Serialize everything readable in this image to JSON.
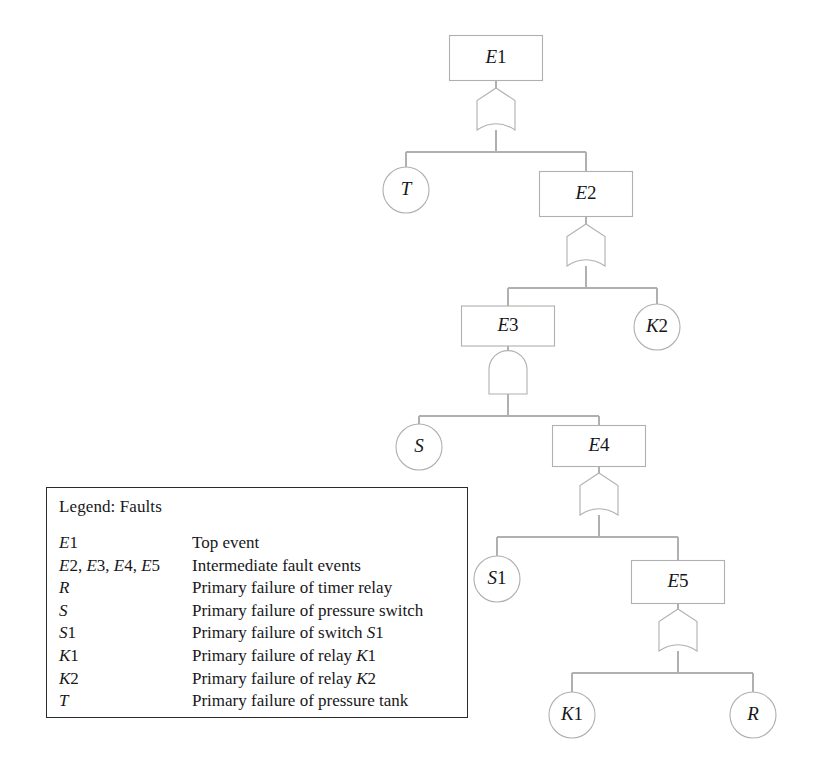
{
  "diagram": {
    "type": "fault-tree",
    "line_color": "#b0b0b0",
    "text_color": "#17171a",
    "legend_border_color": "#2b2b2b",
    "nodes": [
      {
        "id": "E1",
        "label": "E1",
        "shape": "rect",
        "kind": "top-event",
        "cx": 496,
        "cy": 58,
        "w": 93,
        "h": 45,
        "italic_prefix": "E",
        "rest": "1"
      },
      {
        "id": "E2",
        "label": "E2",
        "shape": "rect",
        "kind": "intermediate-event",
        "cx": 586,
        "cy": 194,
        "w": 93,
        "h": 45,
        "italic_prefix": "E",
        "rest": "2"
      },
      {
        "id": "E3",
        "label": "E3",
        "shape": "rect",
        "kind": "intermediate-event",
        "cx": 508,
        "cy": 326,
        "w": 93,
        "h": 40,
        "italic_prefix": "E",
        "rest": "3"
      },
      {
        "id": "E4",
        "label": "E4",
        "shape": "rect",
        "kind": "intermediate-event",
        "cx": 599,
        "cy": 446,
        "w": 93,
        "h": 41,
        "italic_prefix": "E",
        "rest": "4"
      },
      {
        "id": "E5",
        "label": "E5",
        "shape": "rect",
        "kind": "intermediate-event",
        "cx": 678,
        "cy": 582,
        "w": 93,
        "h": 43,
        "italic_prefix": "E",
        "rest": "5"
      },
      {
        "id": "T",
        "label": "T",
        "shape": "circle",
        "kind": "basic-event",
        "cx": 406,
        "cy": 190,
        "r": 23,
        "italic_prefix": "T",
        "rest": ""
      },
      {
        "id": "K2",
        "label": "K2",
        "shape": "circle",
        "kind": "basic-event",
        "cx": 657,
        "cy": 327,
        "r": 23,
        "italic_prefix": "K",
        "rest": "2"
      },
      {
        "id": "S",
        "label": "S",
        "shape": "circle",
        "kind": "basic-event",
        "cx": 419,
        "cy": 447,
        "r": 23,
        "italic_prefix": "S",
        "rest": ""
      },
      {
        "id": "S1",
        "label": "S1",
        "shape": "circle",
        "kind": "basic-event",
        "cx": 497,
        "cy": 579,
        "r": 23,
        "italic_prefix": "S",
        "rest": "1"
      },
      {
        "id": "K1",
        "label": "K1",
        "shape": "circle",
        "kind": "basic-event",
        "cx": 572,
        "cy": 715,
        "r": 23,
        "italic_prefix": "K",
        "rest": "1"
      },
      {
        "id": "R",
        "label": "R",
        "shape": "circle",
        "kind": "basic-event",
        "cx": 753,
        "cy": 715,
        "r": 23,
        "italic_prefix": "R",
        "rest": ""
      }
    ],
    "gates": [
      {
        "id": "G1",
        "gate_type": "OR",
        "parent": "E1",
        "cx": 496,
        "top": 88,
        "children": [
          "T",
          "E2"
        ]
      },
      {
        "id": "G2",
        "gate_type": "OR",
        "parent": "E2",
        "cx": 586,
        "top": 224,
        "children": [
          "E3",
          "K2"
        ]
      },
      {
        "id": "G3",
        "gate_type": "AND",
        "parent": "E3",
        "cx": 508,
        "top": 352,
        "children": [
          "S",
          "E4"
        ]
      },
      {
        "id": "G4",
        "gate_type": "OR",
        "parent": "E4",
        "cx": 599,
        "top": 473,
        "children": [
          "S1",
          "E5"
        ]
      },
      {
        "id": "G5",
        "gate_type": "OR",
        "parent": "E5",
        "cx": 678,
        "top": 609,
        "children": [
          "K1",
          "R"
        ]
      }
    ]
  },
  "legend": {
    "title": "Legend: Faults",
    "rows": [
      {
        "symbol": "E1",
        "symbol_italic_parts": [
          [
            "E",
            "i"
          ],
          [
            "1",
            "u"
          ]
        ],
        "description": "Top event",
        "desc_parts": [
          [
            "Top event",
            "u"
          ]
        ]
      },
      {
        "symbol": "E2, E3, E4, E5",
        "symbol_italic_parts": [
          [
            "E",
            "i"
          ],
          [
            "2, ",
            "u"
          ],
          [
            "E",
            "i"
          ],
          [
            "3, ",
            "u"
          ],
          [
            "E",
            "i"
          ],
          [
            "4, ",
            "u"
          ],
          [
            "E",
            "i"
          ],
          [
            "5",
            "u"
          ]
        ],
        "description": "Intermediate fault events",
        "desc_parts": [
          [
            "Intermediate fault events",
            "u"
          ]
        ]
      },
      {
        "symbol": "R",
        "symbol_italic_parts": [
          [
            "R",
            "i"
          ]
        ],
        "description": "Primary failure of timer relay",
        "desc_parts": [
          [
            "Primary failure of timer relay",
            "u"
          ]
        ]
      },
      {
        "symbol": "S",
        "symbol_italic_parts": [
          [
            "S",
            "i"
          ]
        ],
        "description": "Primary failure of pressure switch",
        "desc_parts": [
          [
            "Primary failure of pressure switch",
            "u"
          ]
        ]
      },
      {
        "symbol": "S1",
        "symbol_italic_parts": [
          [
            "S",
            "i"
          ],
          [
            "1",
            "u"
          ]
        ],
        "description": "Primary failure of switch S1",
        "desc_parts": [
          [
            "Primary failure of switch ",
            "u"
          ],
          [
            "S",
            "i"
          ],
          [
            "1",
            "u"
          ]
        ]
      },
      {
        "symbol": "K1",
        "symbol_italic_parts": [
          [
            "K",
            "i"
          ],
          [
            "1",
            "u"
          ]
        ],
        "description": "Primary failure of relay K1",
        "desc_parts": [
          [
            "Primary failure of relay ",
            "u"
          ],
          [
            "K",
            "i"
          ],
          [
            "1",
            "u"
          ]
        ]
      },
      {
        "symbol": "K2",
        "symbol_italic_parts": [
          [
            "K",
            "i"
          ],
          [
            "2",
            "u"
          ]
        ],
        "description": "Primary failure of relay K2",
        "desc_parts": [
          [
            "Primary failure of relay ",
            "u"
          ],
          [
            "K",
            "i"
          ],
          [
            "2",
            "u"
          ]
        ]
      },
      {
        "symbol": "T",
        "symbol_italic_parts": [
          [
            "T",
            "i"
          ]
        ],
        "description": "Primary failure of pressure tank",
        "desc_parts": [
          [
            "Primary failure of pressure tank",
            "u"
          ]
        ]
      }
    ]
  }
}
